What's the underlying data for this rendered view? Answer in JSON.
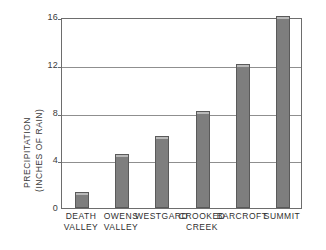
{
  "chart_data": {
    "type": "bar",
    "title": "",
    "xlabel": "",
    "ylabel_line1": "PRECIPITATION",
    "ylabel_line2": "(INCHES OF RAIN)",
    "ylim": [
      0,
      16
    ],
    "yticks": [
      16,
      12,
      8,
      4,
      0
    ],
    "grid": true,
    "legend": "none",
    "categories": [
      "DEATH VALLEY",
      "OWENS VALLEY",
      "WESTGARD",
      "CROOKED CREEK",
      "BARCROFT",
      "SUMMIT"
    ],
    "category_lines": [
      [
        "DEATH",
        "VALLEY"
      ],
      [
        "OWENS",
        "VALLEY"
      ],
      [
        "WESTGARD",
        ""
      ],
      [
        "CROOKED",
        "CREEK"
      ],
      [
        "BARCROFT",
        ""
      ],
      [
        "SUMMIT",
        ""
      ]
    ],
    "values": [
      1.3,
      4.5,
      6.0,
      8.1,
      12.1,
      16.1
    ],
    "bar_color": "#7e7e7e",
    "bar_edge_color": "#5a5a5a",
    "axis_color": "#6d6d6d",
    "grid_color": "#8f8f8f"
  }
}
